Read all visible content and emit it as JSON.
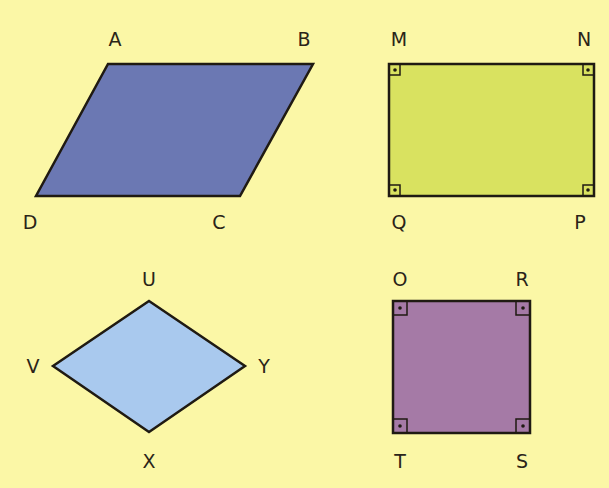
{
  "colors": {
    "background": "#fbf7a6",
    "stroke": "#1f1a12",
    "parallelogram_fill": "#6b78b3",
    "rectangle_fill": "#d9e260",
    "rhombus_fill": "#a9c9ee",
    "square_fill": "#a57aa6"
  },
  "shapes": [
    {
      "name": "parallelogram",
      "labels": {
        "top_left": "A",
        "top_right": "B",
        "bottom_right": "C",
        "bottom_left": "D"
      },
      "right_angle_marks": false
    },
    {
      "name": "rectangle",
      "labels": {
        "top_left": "M",
        "top_right": "N",
        "bottom_right": "P",
        "bottom_left": "Q"
      },
      "right_angle_marks": true
    },
    {
      "name": "rhombus",
      "labels": {
        "top": "U",
        "right": "Y",
        "bottom": "X",
        "left": "V"
      },
      "right_angle_marks": false
    },
    {
      "name": "square",
      "labels": {
        "top_left": "O",
        "top_right": "R",
        "bottom_right": "S",
        "bottom_left": "T"
      },
      "right_angle_marks": true
    }
  ]
}
